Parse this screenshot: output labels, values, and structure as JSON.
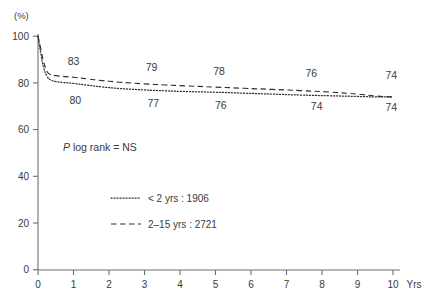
{
  "chart_data": {
    "type": "line",
    "title": "",
    "subtitle": "",
    "xlabel": "Yrs",
    "ylabel": "(%)",
    "xlim": [
      0,
      10
    ],
    "ylim": [
      0,
      100
    ],
    "grid": false,
    "legend_position": "center",
    "x_ticks": [
      "0",
      "1",
      "2",
      "3",
      "4",
      "5",
      "6",
      "7",
      "8",
      "9",
      "10"
    ],
    "x_tick_values": [
      0,
      1,
      2,
      3,
      4,
      5,
      6,
      7,
      8,
      9,
      10
    ],
    "y_ticks": [
      "0",
      "20",
      "40",
      "60",
      "80",
      "100"
    ],
    "y_tick_values": [
      0,
      20,
      40,
      60,
      80,
      100
    ],
    "annotations": [
      {
        "name": "p-value-annotation",
        "text_italic": "P",
        "text": " log rank = NS",
        "x": 0.75,
        "y": 48
      }
    ],
    "series": [
      {
        "name": "< 2 yrs",
        "legend_label": "< 2 yrs : 1906",
        "n": 1906,
        "style": "dotted",
        "color": "#2e2e2e",
        "x": [
          0,
          0.08,
          0.16,
          0.25,
          0.35,
          0.5,
          0.7,
          1.0,
          1.4,
          1.8,
          2.3,
          3.0,
          3.6,
          4.2,
          5.0,
          5.8,
          6.6,
          7.4,
          8.2,
          9.0,
          9.5,
          10.0
        ],
        "y": [
          100,
          92.5,
          86.5,
          83.0,
          81.3,
          80.6,
          80.2,
          79.8,
          79.0,
          78.3,
          77.6,
          77.0,
          76.6,
          76.3,
          76.0,
          75.6,
          75.2,
          74.8,
          74.5,
          74.2,
          74.0,
          74.0
        ],
        "data_labels": [
          {
            "value": "80",
            "x": 1.05,
            "y": 71.0
          },
          {
            "value": "77",
            "x": 3.25,
            "y": 69.8
          },
          {
            "value": "76",
            "x": 5.15,
            "y": 69.0
          },
          {
            "value": "74",
            "x": 7.85,
            "y": 68.4
          },
          {
            "value": "74",
            "x": 9.95,
            "y": 68.0
          }
        ]
      },
      {
        "name": "2-15 yrs",
        "legend_label": "2–15 yrs : 2721",
        "n": 2721,
        "style": "dashed",
        "color": "#2e2e2e",
        "x": [
          0,
          0.08,
          0.16,
          0.25,
          0.35,
          0.5,
          0.7,
          1.0,
          1.4,
          1.8,
          2.3,
          3.0,
          3.6,
          4.2,
          5.0,
          5.8,
          6.6,
          7.4,
          8.2,
          9.0,
          9.5,
          10.0
        ],
        "y": [
          100,
          94.5,
          89.0,
          85.0,
          83.6,
          83.1,
          82.8,
          82.4,
          81.7,
          81.0,
          80.3,
          79.6,
          79.1,
          78.7,
          78.2,
          77.7,
          77.2,
          76.7,
          76.1,
          75.2,
          74.4,
          74.0
        ],
        "data_labels": [
          {
            "value": "83",
            "x": 1.0,
            "y": 87.5
          },
          {
            "value": "79",
            "x": 3.2,
            "y": 85.0
          },
          {
            "value": "78",
            "x": 5.1,
            "y": 83.5
          },
          {
            "value": "76",
            "x": 7.7,
            "y": 82.5
          },
          {
            "value": "74",
            "x": 9.95,
            "y": 81.6
          }
        ]
      }
    ]
  }
}
